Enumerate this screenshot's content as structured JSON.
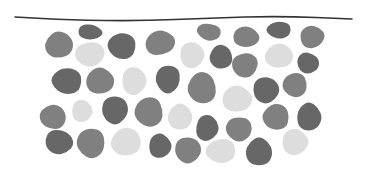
{
  "diagram": {
    "title": "",
    "width": 365,
    "height": 175,
    "background": "#ffffff",
    "surface_line": {
      "points": [
        [
          15,
          17
        ],
        [
          70,
          20
        ],
        [
          140,
          21
        ],
        [
          210,
          18
        ],
        [
          280,
          16
        ],
        [
          352,
          19
        ]
      ],
      "color": "#333333",
      "stroke_width": 1.6
    },
    "shades": {
      "dark": "#676767",
      "medium": "#808080",
      "light": "#dddddd"
    },
    "particles": [
      {
        "cx": 59,
        "cy": 45,
        "rx": 15,
        "ry": 14,
        "rot": -10,
        "shade": "medium"
      },
      {
        "cx": 90,
        "cy": 32,
        "rx": 13,
        "ry": 8,
        "rot": 5,
        "shade": "dark"
      },
      {
        "cx": 90,
        "cy": 54,
        "rx": 16,
        "ry": 13,
        "rot": -8,
        "shade": "light"
      },
      {
        "cx": 122,
        "cy": 46,
        "rx": 15,
        "ry": 14,
        "rot": 10,
        "shade": "dark"
      },
      {
        "cx": 160,
        "cy": 43,
        "rx": 16,
        "ry": 13,
        "rot": -12,
        "shade": "medium"
      },
      {
        "cx": 192,
        "cy": 55,
        "rx": 13,
        "ry": 14,
        "rot": 0,
        "shade": "light"
      },
      {
        "cx": 209,
        "cy": 32,
        "rx": 13,
        "ry": 9,
        "rot": 10,
        "shade": "medium"
      },
      {
        "cx": 221,
        "cy": 57,
        "rx": 12,
        "ry": 13,
        "rot": -15,
        "shade": "dark"
      },
      {
        "cx": 246,
        "cy": 37,
        "rx": 14,
        "ry": 11,
        "rot": 5,
        "shade": "medium"
      },
      {
        "cx": 245,
        "cy": 65,
        "rx": 14,
        "ry": 13,
        "rot": -20,
        "shade": "medium"
      },
      {
        "cx": 279,
        "cy": 30,
        "rx": 13,
        "ry": 9,
        "rot": 0,
        "shade": "dark"
      },
      {
        "cx": 279,
        "cy": 56,
        "rx": 15,
        "ry": 13,
        "rot": -5,
        "shade": "light"
      },
      {
        "cx": 312,
        "cy": 37,
        "rx": 13,
        "ry": 12,
        "rot": -10,
        "shade": "medium"
      },
      {
        "cx": 308,
        "cy": 63,
        "rx": 12,
        "ry": 11,
        "rot": 25,
        "shade": "dark"
      },
      {
        "cx": 67,
        "cy": 81,
        "rx": 16,
        "ry": 14,
        "rot": 5,
        "shade": "dark"
      },
      {
        "cx": 100,
        "cy": 81,
        "rx": 15,
        "ry": 14,
        "rot": -5,
        "shade": "medium"
      },
      {
        "cx": 134,
        "cy": 81,
        "rx": 13,
        "ry": 15,
        "rot": 0,
        "shade": "light"
      },
      {
        "cx": 168,
        "cy": 79,
        "rx": 13,
        "ry": 15,
        "rot": 5,
        "shade": "dark"
      },
      {
        "cx": 202,
        "cy": 88,
        "rx": 15,
        "ry": 17,
        "rot": -10,
        "shade": "medium"
      },
      {
        "cx": 237,
        "cy": 99,
        "rx": 16,
        "ry": 14,
        "rot": 0,
        "shade": "light"
      },
      {
        "cx": 266,
        "cy": 90,
        "rx": 14,
        "ry": 14,
        "rot": 0,
        "shade": "dark"
      },
      {
        "cx": 295,
        "cy": 85,
        "rx": 13,
        "ry": 13,
        "rot": -10,
        "shade": "medium"
      },
      {
        "cx": 53,
        "cy": 117,
        "rx": 14,
        "ry": 13,
        "rot": 15,
        "shade": "medium"
      },
      {
        "cx": 82,
        "cy": 111,
        "rx": 11,
        "ry": 12,
        "rot": 0,
        "shade": "light"
      },
      {
        "cx": 115,
        "cy": 110,
        "rx": 14,
        "ry": 15,
        "rot": 0,
        "shade": "dark"
      },
      {
        "cx": 149,
        "cy": 112,
        "rx": 15,
        "ry": 16,
        "rot": -10,
        "shade": "medium"
      },
      {
        "cx": 180,
        "cy": 117,
        "rx": 13,
        "ry": 14,
        "rot": 0,
        "shade": "light"
      },
      {
        "cx": 207,
        "cy": 128,
        "rx": 12,
        "ry": 14,
        "rot": 10,
        "shade": "dark"
      },
      {
        "cx": 239,
        "cy": 129,
        "rx": 14,
        "ry": 13,
        "rot": 0,
        "shade": "medium"
      },
      {
        "cx": 276,
        "cy": 117,
        "rx": 14,
        "ry": 14,
        "rot": 0,
        "shade": "medium"
      },
      {
        "cx": 309,
        "cy": 117,
        "rx": 13,
        "ry": 15,
        "rot": 0,
        "shade": "dark"
      },
      {
        "cx": 59,
        "cy": 142,
        "rx": 15,
        "ry": 13,
        "rot": 10,
        "shade": "dark"
      },
      {
        "cx": 91,
        "cy": 143,
        "rx": 15,
        "ry": 16,
        "rot": 0,
        "shade": "medium"
      },
      {
        "cx": 126,
        "cy": 142,
        "rx": 16,
        "ry": 15,
        "rot": -10,
        "shade": "light"
      },
      {
        "cx": 160,
        "cy": 146,
        "rx": 12,
        "ry": 13,
        "rot": 0,
        "shade": "dark"
      },
      {
        "cx": 188,
        "cy": 150,
        "rx": 14,
        "ry": 14,
        "rot": 0,
        "shade": "medium"
      },
      {
        "cx": 221,
        "cy": 151,
        "rx": 16,
        "ry": 13,
        "rot": -5,
        "shade": "light"
      },
      {
        "cx": 259,
        "cy": 152,
        "rx": 14,
        "ry": 15,
        "rot": 0,
        "shade": "dark"
      },
      {
        "cx": 295,
        "cy": 142,
        "rx": 14,
        "ry": 14,
        "rot": 0,
        "shade": "light"
      }
    ]
  }
}
